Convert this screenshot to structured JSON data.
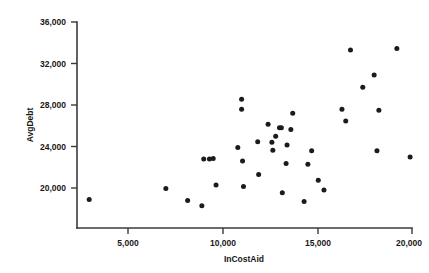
{
  "chart_data": {
    "type": "scatter",
    "title": "",
    "xlabel": "InCostAid",
    "ylabel": "AvgDebt",
    "xlim": [
      2000,
      20500
    ],
    "ylim": [
      18000,
      36000
    ],
    "xticks": [
      5000,
      10000,
      15000,
      20000
    ],
    "xtick_labels": [
      "5,000",
      "10,000",
      "15,000",
      "20,000"
    ],
    "yticks": [
      20000,
      24000,
      28000,
      32000,
      36000
    ],
    "ytick_labels": [
      "20,000",
      "24,000",
      "28,000",
      "32,000",
      "36,000"
    ],
    "grid": false,
    "legend": null,
    "marker": "circle",
    "marker_color": "#1b1b1b",
    "series": [
      {
        "name": "colleges",
        "points": [
          [
            2950,
            18900
          ],
          [
            7000,
            19950
          ],
          [
            8150,
            18800
          ],
          [
            8900,
            18300
          ],
          [
            9000,
            22800
          ],
          [
            9300,
            22800
          ],
          [
            9500,
            22850
          ],
          [
            9650,
            20300
          ],
          [
            10800,
            23900
          ],
          [
            11000,
            28550
          ],
          [
            11000,
            27600
          ],
          [
            11050,
            22600
          ],
          [
            11100,
            20150
          ],
          [
            11850,
            24450
          ],
          [
            11900,
            21300
          ],
          [
            12400,
            26150
          ],
          [
            12600,
            24400
          ],
          [
            12650,
            23650
          ],
          [
            12800,
            25000
          ],
          [
            13000,
            25800
          ],
          [
            13100,
            25800
          ],
          [
            13150,
            19550
          ],
          [
            13350,
            22350
          ],
          [
            13400,
            24150
          ],
          [
            13600,
            25650
          ],
          [
            13700,
            27200
          ],
          [
            14300,
            18700
          ],
          [
            14500,
            22300
          ],
          [
            14700,
            23600
          ],
          [
            15050,
            20750
          ],
          [
            15350,
            19800
          ],
          [
            16300,
            27600
          ],
          [
            16500,
            26450
          ],
          [
            16750,
            33300
          ],
          [
            17400,
            29700
          ],
          [
            18000,
            30900
          ],
          [
            18150,
            23600
          ],
          [
            18250,
            27500
          ],
          [
            19200,
            33450
          ],
          [
            19900,
            23000
          ]
        ]
      }
    ]
  },
  "axes": {
    "y_axis_title": "AvgDebt",
    "x_axis_title": "InCostAid"
  }
}
